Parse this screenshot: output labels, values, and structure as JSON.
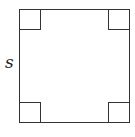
{
  "diagram": {
    "shape": "square",
    "side_label": "s",
    "right_angle_markers": [
      "top-left",
      "top-right",
      "bottom-left",
      "bottom-right"
    ],
    "stroke_color": "#333333"
  }
}
